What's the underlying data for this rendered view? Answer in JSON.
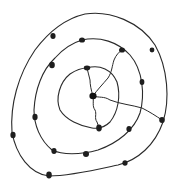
{
  "diagram": {
    "title": "",
    "ink_color": "#2a2a2a",
    "background_color": "#ffffff",
    "hub": {
      "id": "hub"
    },
    "loops": [
      {
        "id": "inner",
        "node_count": 2,
        "nodes": [
          "inner-top",
          "inner-bottom"
        ]
      },
      {
        "id": "middle",
        "node_count": 8,
        "nodes": [
          "middle-top",
          "middle-upper-left",
          "middle-left",
          "middle-lower-left",
          "middle-bottom",
          "middle-lower-right",
          "middle-right",
          "middle-upper-right"
        ]
      },
      {
        "id": "outer",
        "node_count": 6,
        "nodes": [
          "outer-upper-left",
          "outer-upper-right",
          "outer-right",
          "outer-lower-right",
          "outer-bottom-left",
          "outer-left"
        ]
      }
    ],
    "spokes": [
      {
        "from": "hub",
        "to": "inner-top"
      },
      {
        "from": "hub",
        "to": "middle-upper-right"
      },
      {
        "from": "hub",
        "to": "inner-bottom"
      },
      {
        "from": "hub",
        "to": "outer-right"
      }
    ]
  }
}
